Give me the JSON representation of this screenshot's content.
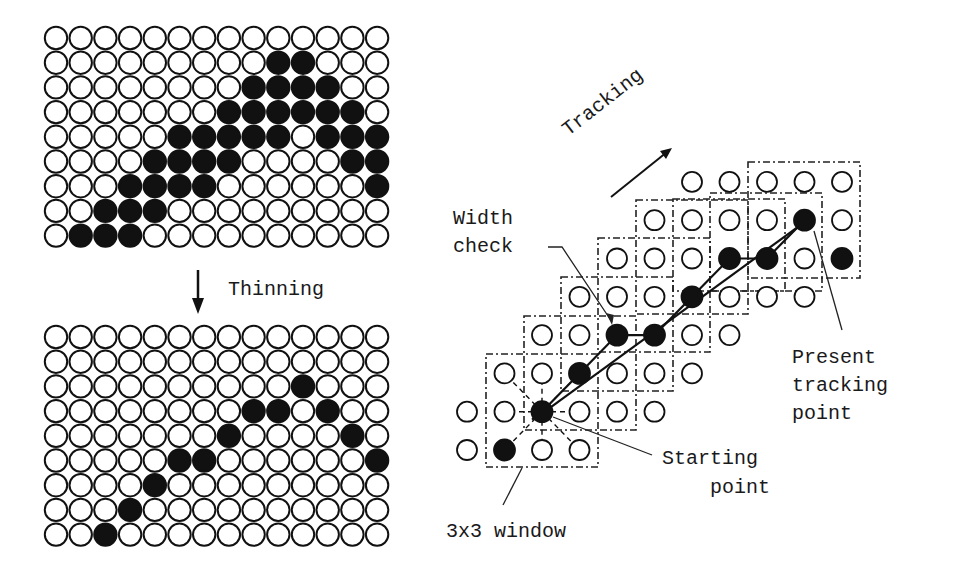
{
  "colors": {
    "ink": "#111111",
    "background": "#ffffff"
  },
  "labels": {
    "thinning": "Thinning",
    "tracking": "Tracking",
    "width_check_1": "Width",
    "width_check_2": "check",
    "present_1": "Present",
    "present_2": "tracking",
    "present_3": "point",
    "starting_1": "Starting",
    "starting_2": "point",
    "window": "3x3 window"
  },
  "grids": {
    "cols": 14,
    "rows": 9,
    "before_thinning_filled": [
      [],
      [
        9,
        10
      ],
      [
        8,
        9,
        10,
        11
      ],
      [
        7,
        8,
        9,
        10,
        11,
        12
      ],
      [
        5,
        6,
        7,
        8,
        9,
        11,
        12,
        13
      ],
      [
        4,
        5,
        6,
        7,
        12,
        13
      ],
      [
        3,
        4,
        5,
        6,
        13
      ],
      [
        2,
        3,
        4
      ],
      [
        1,
        2,
        3
      ]
    ],
    "after_thinning_filled": [
      [],
      [],
      [
        10
      ],
      [
        8,
        9,
        11
      ],
      [
        7,
        12
      ],
      [
        5,
        6,
        13
      ],
      [
        4
      ],
      [
        3
      ],
      [
        2
      ]
    ]
  },
  "tracking_diagram": {
    "dot_rows": [
      {
        "row": 0,
        "cols": [
          0,
          1,
          2,
          3
        ],
        "filled": [
          1
        ]
      },
      {
        "row": 1,
        "cols": [
          0,
          1,
          2,
          3,
          4,
          5
        ],
        "filled": [
          2
        ]
      },
      {
        "row": 2,
        "cols": [
          1,
          2,
          3,
          4,
          5,
          6
        ],
        "filled": [
          3
        ]
      },
      {
        "row": 3,
        "cols": [
          2,
          3,
          4,
          5,
          6,
          7
        ],
        "filled": [
          4,
          5
        ]
      },
      {
        "row": 4,
        "cols": [
          3,
          4,
          5,
          6,
          7,
          8,
          9
        ],
        "filled": [
          6
        ]
      },
      {
        "row": 5,
        "cols": [
          4,
          5,
          6,
          7,
          8,
          9,
          10
        ],
        "filled": [
          7,
          8,
          10
        ]
      },
      {
        "row": 6,
        "cols": [
          5,
          6,
          7,
          8,
          9,
          10
        ],
        "filled": [
          9
        ]
      },
      {
        "row": 7,
        "cols": [
          6,
          7,
          8,
          9,
          10
        ],
        "filled": []
      }
    ],
    "starting_point": [
      2,
      1
    ],
    "present_tracking_point": [
      9,
      6
    ]
  }
}
